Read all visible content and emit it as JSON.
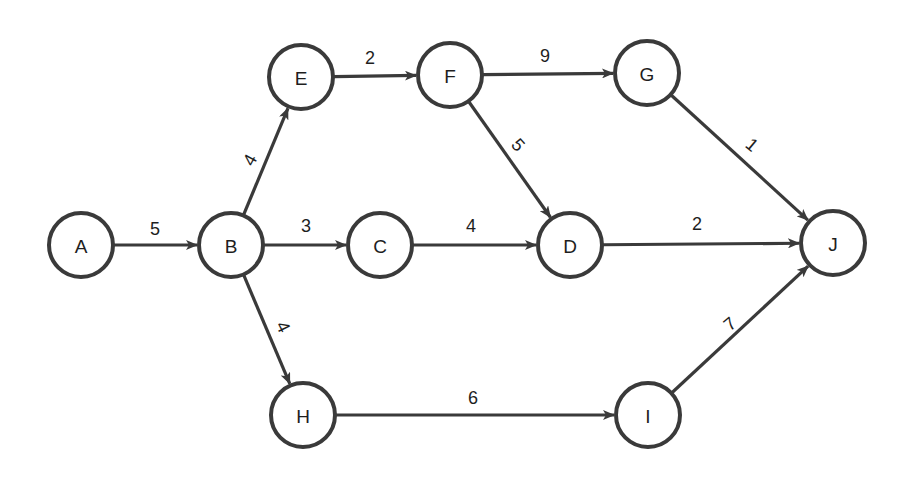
{
  "diagram": {
    "type": "directed-network",
    "colors": {
      "stroke": "#3a3a3a",
      "text": "#1e1e1e",
      "background": "#ffffff"
    },
    "node_radius": 32,
    "nodes": [
      {
        "id": "A",
        "label": "A",
        "x": 81,
        "y": 245
      },
      {
        "id": "B",
        "label": "B",
        "x": 231,
        "y": 245
      },
      {
        "id": "C",
        "label": "C",
        "x": 380,
        "y": 245
      },
      {
        "id": "D",
        "label": "D",
        "x": 570,
        "y": 245
      },
      {
        "id": "E",
        "label": "E",
        "x": 301,
        "y": 77
      },
      {
        "id": "F",
        "label": "F",
        "x": 450,
        "y": 75
      },
      {
        "id": "G",
        "label": "G",
        "x": 647,
        "y": 73
      },
      {
        "id": "H",
        "label": "H",
        "x": 303,
        "y": 415
      },
      {
        "id": "I",
        "label": "I",
        "x": 648,
        "y": 415
      },
      {
        "id": "J",
        "label": "J",
        "x": 833,
        "y": 243
      }
    ],
    "edges": [
      {
        "from": "A",
        "to": "B",
        "weight": "5",
        "lx": 155,
        "ly": 229,
        "rot": 0
      },
      {
        "from": "B",
        "to": "E",
        "weight": "4",
        "lx": 250,
        "ly": 160,
        "rot": -62
      },
      {
        "from": "B",
        "to": "C",
        "weight": "3",
        "lx": 306,
        "ly": 226,
        "rot": 0
      },
      {
        "from": "B",
        "to": "H",
        "weight": "4",
        "lx": 283,
        "ly": 327,
        "rot": 64
      },
      {
        "from": "E",
        "to": "F",
        "weight": "2",
        "lx": 370,
        "ly": 58,
        "rot": 0
      },
      {
        "from": "F",
        "to": "G",
        "weight": "9",
        "lx": 545,
        "ly": 56,
        "rot": 0
      },
      {
        "from": "F",
        "to": "D",
        "weight": "5",
        "lx": 518,
        "ly": 145,
        "rot": 48
      },
      {
        "from": "C",
        "to": "D",
        "weight": "4",
        "lx": 471,
        "ly": 226,
        "rot": 0
      },
      {
        "from": "G",
        "to": "J",
        "weight": "1",
        "lx": 752,
        "ly": 145,
        "rot": 40
      },
      {
        "from": "D",
        "to": "J",
        "weight": "2",
        "lx": 697,
        "ly": 224,
        "rot": 0
      },
      {
        "from": "H",
        "to": "I",
        "weight": "6",
        "lx": 473,
        "ly": 398,
        "rot": 0
      },
      {
        "from": "I",
        "to": "J",
        "weight": "7",
        "lx": 730,
        "ly": 324,
        "rot": -40
      }
    ]
  }
}
